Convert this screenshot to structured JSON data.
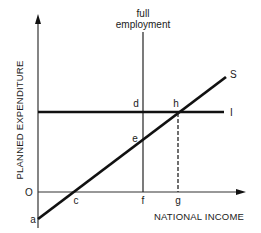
{
  "diagram": {
    "y_axis_label": "PLANNED EXPENDITURE",
    "x_axis_label": "NATIONAL INCOME",
    "annotation_line1": "full",
    "annotation_line2": "employment",
    "origin_label": "O",
    "curves": {
      "saving": "S",
      "investment": "I"
    },
    "points": {
      "a": "a",
      "c": "c",
      "d": "d",
      "e": "e",
      "f": "f",
      "g": "g",
      "h": "h"
    },
    "colors": {
      "line": "#111111",
      "axis": "#333333",
      "background": "#ffffff"
    }
  }
}
